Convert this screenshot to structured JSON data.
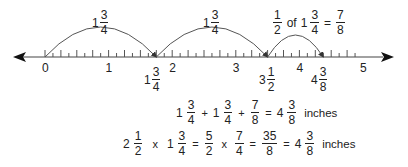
{
  "number_line": {
    "min": 0,
    "max": 5,
    "subdivisions_per_unit": 8,
    "integer_labels": [
      "0",
      "1",
      "2",
      "3",
      "4",
      "5"
    ],
    "marked_points": [
      {
        "whole": "1",
        "num": "3",
        "den": "4",
        "value": 1.75
      },
      {
        "whole": "3",
        "num": "1",
        "den": "2",
        "value": 3.5
      },
      {
        "whole": "4",
        "num": "3",
        "den": "8",
        "value": 4.375
      }
    ],
    "jumps": [
      {
        "from": 0,
        "to": 1.75,
        "label": {
          "whole": "1",
          "num": "3",
          "den": "4"
        }
      },
      {
        "from": 1.75,
        "to": 3.5,
        "label": {
          "whole": "1",
          "num": "3",
          "den": "4"
        }
      },
      {
        "from": 3.5,
        "to": 4.375,
        "label": {
          "num1": "1",
          "den1": "2",
          "of": "of",
          "whole": "1",
          "num2": "3",
          "den2": "4",
          "eq": "=",
          "num3": "7",
          "den3": "8"
        }
      }
    ]
  },
  "equations": {
    "sum": {
      "t1": {
        "whole": "1",
        "num": "3",
        "den": "4"
      },
      "plus1": "+",
      "t2": {
        "whole": "1",
        "num": "3",
        "den": "4"
      },
      "plus2": "+",
      "t3": {
        "num": "7",
        "den": "8"
      },
      "eq": "=",
      "result": {
        "whole": "4",
        "num": "3",
        "den": "8"
      },
      "unit": "inches"
    },
    "product": {
      "t1": {
        "whole": "2",
        "num": "1",
        "den": "2"
      },
      "times1": "x",
      "t2": {
        "whole": "1",
        "num": "3",
        "den": "4"
      },
      "eq1": "=",
      "t3": {
        "num": "5",
        "den": "2"
      },
      "times2": "x",
      "t4": {
        "num": "7",
        "den": "4"
      },
      "eq2": "=",
      "t5": {
        "num": "35",
        "den": "8"
      },
      "eq3": "=",
      "result": {
        "whole": "4",
        "num": "3",
        "den": "8"
      },
      "unit": "inches"
    }
  }
}
